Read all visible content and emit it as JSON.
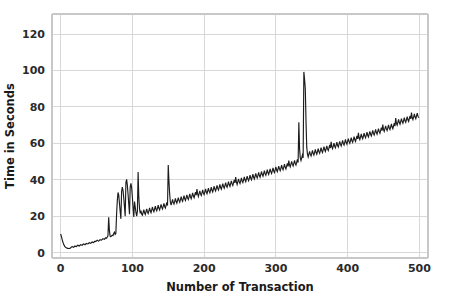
{
  "chart_data": {
    "type": "line",
    "title": "",
    "subtitle": "",
    "xlabel": "Number of Transaction",
    "ylabel": "Time in Seconds",
    "xlim": [
      -12,
      512
    ],
    "ylim": [
      -3,
      131
    ],
    "xticks": [
      0,
      100,
      200,
      300,
      400,
      500
    ],
    "xticklabels": [
      "0",
      "100",
      "200",
      "300",
      "400",
      "500"
    ],
    "yticks": [
      0,
      20,
      40,
      60,
      80,
      100,
      120
    ],
    "yticklabels": [
      "0",
      "20",
      "40",
      "60",
      "80",
      "100",
      "120"
    ],
    "grid": true,
    "grid_axis": "both",
    "legend": null,
    "legend_position": "none",
    "series_color": "#1c1c1c",
    "background_color": "#ffffff",
    "grid_color": "#d4d4d4",
    "annotations": [
      "Overall near-linear upward trend from about 2 s at 20 transactions to about 93 s at 495 transactions",
      "Initial spike of about 10 s at transaction 0 dropping to about 2 s by transaction 12",
      "Dense noisy band of roughly 2-4 s amplitude along the whole trend",
      "Spike cluster between transactions 70 and 110 reaching about 33-40 s",
      "Isolated spike near transaction 108 reaching about 44 s",
      "Isolated spike near transaction 145 reaching about 48 s",
      "Tall spike near transaction 280 reaching about 99 s",
      "Tallest spike near transaction 468 reaching about 128 s, clipped at the top of the axis",
      "Secondary spike near transaction 472 reaching about 103 s",
      "Final upturn at the right edge reaching about 98 s near transaction 498"
    ],
    "x": [
      0,
      1,
      2,
      3,
      4,
      5,
      6,
      7,
      8,
      9,
      10,
      11,
      12,
      13,
      14,
      15,
      16,
      17,
      18,
      19,
      20,
      21,
      22,
      23,
      24,
      25,
      26,
      27,
      28,
      29,
      30,
      31,
      32,
      33,
      34,
      35,
      36,
      37,
      38,
      39,
      40,
      41,
      42,
      43,
      44,
      45,
      46,
      47,
      48,
      49,
      50,
      51,
      52,
      53,
      54,
      55,
      56,
      57,
      58,
      59,
      60,
      61,
      62,
      63,
      64,
      65,
      66,
      67,
      68,
      69,
      70,
      71,
      72,
      73,
      74,
      75,
      76,
      77,
      78,
      79,
      80,
      81,
      82,
      83,
      84,
      85,
      86,
      87,
      88,
      89,
      90,
      91,
      92,
      93,
      94,
      95,
      96,
      97,
      98,
      99,
      100,
      101,
      102,
      103,
      104,
      105,
      106,
      107,
      108,
      109,
      110,
      111,
      112,
      113,
      114,
      115,
      116,
      117,
      118,
      119,
      120,
      121,
      122,
      123,
      124,
      125,
      126,
      127,
      128,
      129,
      130,
      131,
      132,
      133,
      134,
      135,
      136,
      137,
      138,
      139,
      140,
      141,
      142,
      143,
      144,
      145,
      146,
      147,
      148,
      149,
      150,
      151,
      152,
      153,
      154,
      155,
      156,
      157,
      158,
      159,
      160,
      161,
      162,
      163,
      164,
      165,
      166,
      167,
      168,
      169,
      170,
      171,
      172,
      173,
      174,
      175,
      176,
      177,
      178,
      179,
      180,
      181,
      182,
      183,
      184,
      185,
      186,
      187,
      188,
      189,
      190,
      191,
      192,
      193,
      194,
      195,
      196,
      197,
      198,
      199,
      200,
      201,
      202,
      203,
      204,
      205,
      206,
      207,
      208,
      209,
      210,
      211,
      212,
      213,
      214,
      215,
      216,
      217,
      218,
      219,
      220,
      221,
      222,
      223,
      224,
      225,
      226,
      227,
      228,
      229,
      230,
      231,
      232,
      233,
      234,
      235,
      236,
      237,
      238,
      239,
      240,
      241,
      242,
      243,
      244,
      245,
      246,
      247,
      248,
      249,
      250,
      251,
      252,
      253,
      254,
      255,
      256,
      257,
      258,
      259,
      260,
      261,
      262,
      263,
      264,
      265,
      266,
      267,
      268,
      269,
      270,
      271,
      272,
      273,
      274,
      275,
      276,
      277,
      278,
      279,
      280,
      281,
      282,
      283,
      284,
      285,
      286,
      287,
      288,
      289,
      290,
      291,
      292,
      293,
      294,
      295,
      296,
      297,
      298,
      299,
      300,
      301,
      302,
      303,
      304,
      305,
      306,
      307,
      308,
      309,
      310,
      311,
      312,
      313,
      314,
      315,
      316,
      317,
      318,
      319,
      320,
      321,
      322,
      323,
      324,
      325,
      326,
      327,
      328,
      329,
      330,
      331,
      332,
      333,
      334,
      335,
      336,
      337,
      338,
      339,
      340,
      341,
      342,
      343,
      344,
      345,
      346,
      347,
      348,
      349,
      350,
      351,
      352,
      353,
      354,
      355,
      356,
      357,
      358,
      359,
      360,
      361,
      362,
      363,
      364,
      365,
      366,
      367,
      368,
      369,
      370,
      371,
      372,
      373,
      374,
      375,
      376,
      377,
      378,
      379,
      380,
      381,
      382,
      383,
      384,
      385,
      386,
      387,
      388,
      389,
      390,
      391,
      392,
      393,
      394,
      395,
      396,
      397,
      398,
      399,
      400,
      401,
      402,
      403,
      404,
      405,
      406,
      407,
      408,
      409,
      410,
      411,
      412,
      413,
      414,
      415,
      416,
      417,
      418,
      419,
      420,
      421,
      422,
      423,
      424,
      425,
      426,
      427,
      428,
      429,
      430,
      431,
      432,
      433,
      434,
      435,
      436,
      437,
      438,
      439,
      440,
      441,
      442,
      443,
      444,
      445,
      446,
      447,
      448,
      449,
      450,
      451,
      452,
      453,
      454,
      455,
      456,
      457,
      458,
      459,
      460,
      461,
      462,
      463,
      464,
      465,
      466,
      467,
      468,
      469,
      470,
      471,
      472,
      473,
      474,
      475,
      476,
      477,
      478,
      479,
      480,
      481,
      482,
      483,
      484,
      485,
      486,
      487,
      488,
      489,
      490,
      491,
      492,
      493,
      494,
      495,
      496,
      497,
      498,
      499
    ],
    "y": [
      10.2,
      9.0,
      7.4,
      6.0,
      4.8,
      3.9,
      3.3,
      2.9,
      2.6,
      2.4,
      2.3,
      2.2,
      2.2,
      2.3,
      2.6,
      3.0,
      3.3,
      3.1,
      2.9,
      3.2,
      3.6,
      3.4,
      3.3,
      3.7,
      4.0,
      3.8,
      3.6,
      4.0,
      4.3,
      4.1,
      4.0,
      4.4,
      4.7,
      4.5,
      4.3,
      4.7,
      5.0,
      4.8,
      4.7,
      5.1,
      5.4,
      5.2,
      5.1,
      5.5,
      5.8,
      5.6,
      5.5,
      5.9,
      6.2,
      6.0,
      6.4,
      6.8,
      6.5,
      6.3,
      6.7,
      7.1,
      6.9,
      6.8,
      7.2,
      7.6,
      7.4,
      7.3,
      7.7,
      8.1,
      7.9,
      8.5,
      9.2,
      19.4,
      12.0,
      9.0,
      8.7,
      9.1,
      9.5,
      9.3,
      10.5,
      11.2,
      10.0,
      10.6,
      21.0,
      28.5,
      33.0,
      31.5,
      27.0,
      22.5,
      18.5,
      33.5,
      36.0,
      34.0,
      30.0,
      25.0,
      20.0,
      38.5,
      40.2,
      37.0,
      32.0,
      26.5,
      21.0,
      36.0,
      38.0,
      35.5,
      30.5,
      24.5,
      19.5,
      28.0,
      25.0,
      22.0,
      20.0,
      22.5,
      44.2,
      30.0,
      24.0,
      21.5,
      23.0,
      21.0,
      20.5,
      22.0,
      23.5,
      21.8,
      20.9,
      22.4,
      24.0,
      22.3,
      21.4,
      22.9,
      24.5,
      22.8,
      21.9,
      23.4,
      25.0,
      23.3,
      22.4,
      23.9,
      25.5,
      23.8,
      22.9,
      24.4,
      26.0,
      24.3,
      23.4,
      24.9,
      26.5,
      24.8,
      23.9,
      25.4,
      27.0,
      25.3,
      24.4,
      25.9,
      27.5,
      25.8,
      48.0,
      39.0,
      32.0,
      27.5,
      26.0,
      27.6,
      29.2,
      27.5,
      26.6,
      28.1,
      29.7,
      28.0,
      27.1,
      28.6,
      30.2,
      28.5,
      27.6,
      29.1,
      30.7,
      29.0,
      28.1,
      29.6,
      31.2,
      29.5,
      28.6,
      30.1,
      31.7,
      30.0,
      29.1,
      30.6,
      32.2,
      30.5,
      29.6,
      31.1,
      32.7,
      31.0,
      30.1,
      31.6,
      33.2,
      31.5,
      34.8,
      32.2,
      30.8,
      32.3,
      33.9,
      32.2,
      31.3,
      32.8,
      34.4,
      32.7,
      31.8,
      33.3,
      34.9,
      33.2,
      32.3,
      33.8,
      35.4,
      33.7,
      32.8,
      34.3,
      35.9,
      34.2,
      33.3,
      34.8,
      36.4,
      34.7,
      33.8,
      35.3,
      36.9,
      35.2,
      34.3,
      35.8,
      37.4,
      35.7,
      34.8,
      36.3,
      37.9,
      36.2,
      35.3,
      36.8,
      38.4,
      36.7,
      35.8,
      37.3,
      38.9,
      37.2,
      36.3,
      37.8,
      39.4,
      37.7,
      36.8,
      38.3,
      39.9,
      38.2,
      41.5,
      38.8,
      37.4,
      38.9,
      40.5,
      38.8,
      37.9,
      39.4,
      41.0,
      39.3,
      38.4,
      39.9,
      41.5,
      39.8,
      38.9,
      40.4,
      42.0,
      40.3,
      39.4,
      40.9,
      42.5,
      40.8,
      39.9,
      41.4,
      43.0,
      41.3,
      40.4,
      41.9,
      43.5,
      41.8,
      40.9,
      42.4,
      44.0,
      42.3,
      41.4,
      42.9,
      44.5,
      42.8,
      41.9,
      43.4,
      45.0,
      43.3,
      42.4,
      43.9,
      45.5,
      43.8,
      42.9,
      44.4,
      46.0,
      44.3,
      43.4,
      44.9,
      46.5,
      44.8,
      43.9,
      45.4,
      47.0,
      45.3,
      44.4,
      45.9,
      47.5,
      45.8,
      44.9,
      46.4,
      48.0,
      46.3,
      45.4,
      46.9,
      48.5,
      46.8,
      45.9,
      47.4,
      49.0,
      47.3,
      50.5,
      48.0,
      47.0,
      48.5,
      50.1,
      48.4,
      47.5,
      49.0,
      50.6,
      48.9,
      48.0,
      49.5,
      51.1,
      49.4,
      71.5,
      57.0,
      52.0,
      50.5,
      52.0,
      53.5,
      52.0,
      99.2,
      95.0,
      90.0,
      72.0,
      58.0,
      54.0,
      52.5,
      54.0,
      55.6,
      53.9,
      53.0,
      54.5,
      56.1,
      54.4,
      53.5,
      55.0,
      56.6,
      54.9,
      54.0,
      55.5,
      57.1,
      55.4,
      54.5,
      56.0,
      57.6,
      55.9,
      55.0,
      56.5,
      58.1,
      56.4,
      55.5,
      57.0,
      58.6,
      56.9,
      56.0,
      57.5,
      59.1,
      57.4,
      60.8,
      58.0,
      57.0,
      58.5,
      60.1,
      58.4,
      57.5,
      59.0,
      60.6,
      58.9,
      58.0,
      59.5,
      61.1,
      59.4,
      58.5,
      60.0,
      61.6,
      59.9,
      59.0,
      60.5,
      62.1,
      60.4,
      59.5,
      61.0,
      62.6,
      60.9,
      60.0,
      61.5,
      63.1,
      61.4,
      60.5,
      62.0,
      63.6,
      61.9,
      61.0,
      62.5,
      64.1,
      62.4,
      65.8,
      63.0,
      62.0,
      63.5,
      65.1,
      63.4,
      62.5,
      64.0,
      65.6,
      63.9,
      63.0,
      64.5,
      66.1,
      64.4,
      63.5,
      65.0,
      66.6,
      64.9,
      64.0,
      65.5,
      67.1,
      65.4,
      64.5,
      66.0,
      67.6,
      65.9,
      65.0,
      66.5,
      68.1,
      66.4,
      65.5,
      67.0,
      68.6,
      66.9,
      70.3,
      67.5,
      66.5,
      68.0,
      69.6,
      67.9,
      67.0,
      68.5,
      70.1,
      68.4,
      67.5,
      69.0,
      70.6,
      68.9,
      68.0,
      69.5,
      71.1,
      69.4,
      73.8,
      71.0,
      70.0,
      71.5,
      73.1,
      71.4,
      70.5,
      72.0,
      73.6,
      71.9,
      71.0,
      72.5,
      74.1,
      72.4,
      71.5,
      73.0,
      74.6,
      72.9,
      72.0,
      73.5,
      75.1,
      73.4,
      76.8,
      74.0,
      73.0,
      74.5,
      76.1,
      74.4,
      73.5,
      75.0,
      76.6,
      74.9,
      74.0,
      75.5,
      77.1,
      75.4,
      74.5,
      76.0,
      77.6,
      75.9,
      75.0,
      76.5,
      78.1,
      76.4,
      79.8,
      77.0,
      76.0,
      77.5,
      79.1,
      77.4,
      76.5,
      78.0,
      79.6,
      77.9,
      77.0,
      78.5,
      80.1,
      78.4,
      81.5,
      79.0,
      78.0,
      79.5,
      81.1,
      79.4,
      78.5,
      80.0,
      81.6,
      79.9,
      79.0,
      80.5,
      82.1,
      80.4,
      83.5,
      81.0,
      80.0,
      81.5,
      83.1,
      81.4,
      80.5,
      82.0,
      83.6,
      81.9,
      85.5,
      83.0,
      82.0,
      83.5,
      85.1,
      83.4,
      86.0,
      84.0,
      83.0,
      84.5,
      86.1,
      84.4,
      83.5,
      85.0,
      86.6,
      84.9,
      84.0,
      85.5,
      87.1,
      85.4,
      88.5,
      86.0,
      85.0,
      128.5,
      120.0,
      104.0,
      103.5,
      95.0,
      88.0,
      86.5,
      88.0,
      89.6,
      87.9,
      87.0,
      88.5,
      90.1,
      88.4,
      87.5,
      89.0,
      90.6,
      88.9,
      88.0,
      89.5,
      91.1,
      89.4,
      88.5,
      90.0,
      91.6,
      89.9,
      92.5,
      95.5,
      98.2,
      96.0,
      93.5,
      92.0
    ]
  },
  "figure": {
    "width": 449,
    "height": 306,
    "plot_left": 52,
    "plot_right": 428,
    "plot_top": 14,
    "plot_bottom": 258
  }
}
